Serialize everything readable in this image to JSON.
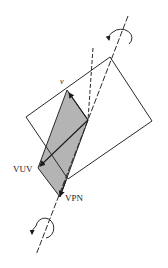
{
  "diagram": {
    "labels": {
      "v": "v",
      "vuv": "VUV",
      "vpn": "VPN"
    },
    "colors": {
      "stroke": "#2a2a2a",
      "shaded_plane": "#b4b4b4",
      "background": "#ffffff"
    },
    "elements": [
      "rotated view plane rectangle",
      "shaded plane (parallelogram)",
      "rotation axis (dashed)",
      "secondary dashed line",
      "rotation arrow top",
      "rotation arrow bottom",
      "v vector arrow",
      "VUV vector arrow",
      "VPN vector arrow"
    ]
  }
}
